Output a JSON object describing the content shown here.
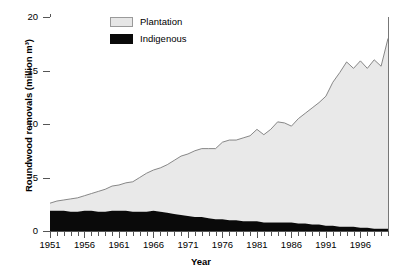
{
  "chart_data": {
    "type": "area",
    "stacked": true,
    "title": "",
    "xlabel": "Year",
    "ylabel": "Roundwood removals (million m³)",
    "xlim": [
      1951,
      2000
    ],
    "ylim": [
      0,
      20
    ],
    "yticks": [
      0,
      5,
      10,
      15,
      20
    ],
    "ytick_labels": [
      "0",
      "5",
      "10",
      "15",
      "20"
    ],
    "xticks": [
      1951,
      1956,
      1961,
      1966,
      1971,
      1976,
      1981,
      1986,
      1991,
      1996
    ],
    "xtick_labels": [
      "1951",
      "1956",
      "1961",
      "1966",
      "1971",
      "1976",
      "1981",
      "1986",
      "1991",
      "1996"
    ],
    "grid": false,
    "legend_position": "top-left-inside",
    "x": [
      1951,
      1952,
      1953,
      1954,
      1955,
      1956,
      1957,
      1958,
      1959,
      1960,
      1961,
      1962,
      1963,
      1964,
      1965,
      1966,
      1967,
      1968,
      1969,
      1970,
      1971,
      1972,
      1973,
      1974,
      1975,
      1976,
      1977,
      1978,
      1979,
      1980,
      1981,
      1982,
      1983,
      1984,
      1985,
      1986,
      1987,
      1988,
      1989,
      1990,
      1991,
      1992,
      1993,
      1994,
      1995,
      1996,
      1997,
      1998,
      1999,
      2000
    ],
    "series": [
      {
        "name": "Indigenous",
        "color": "#0a0a0a",
        "values": [
          1.9,
          1.9,
          1.9,
          1.8,
          1.8,
          1.9,
          1.9,
          1.8,
          1.8,
          1.9,
          1.9,
          1.9,
          1.8,
          1.8,
          1.8,
          1.9,
          1.8,
          1.7,
          1.6,
          1.5,
          1.4,
          1.3,
          1.3,
          1.2,
          1.1,
          1.1,
          1.0,
          1.0,
          0.9,
          0.9,
          0.9,
          0.8,
          0.8,
          0.8,
          0.8,
          0.8,
          0.7,
          0.7,
          0.6,
          0.6,
          0.5,
          0.5,
          0.4,
          0.4,
          0.4,
          0.3,
          0.3,
          0.2,
          0.2,
          0.2
        ]
      },
      {
        "name": "Plantation",
        "color": "#e6e6e6",
        "values": [
          0.7,
          0.9,
          1.0,
          1.2,
          1.3,
          1.4,
          1.6,
          1.9,
          2.1,
          2.3,
          2.4,
          2.6,
          2.8,
          3.2,
          3.6,
          3.8,
          4.1,
          4.5,
          5.0,
          5.5,
          5.8,
          6.2,
          6.4,
          6.5,
          6.6,
          7.2,
          7.5,
          7.5,
          7.8,
          8.0,
          8.6,
          8.2,
          8.7,
          9.4,
          9.3,
          9.0,
          9.8,
          10.3,
          10.9,
          11.4,
          12.1,
          13.4,
          14.4,
          15.4,
          14.8,
          15.6,
          14.9,
          15.8,
          15.2,
          17.8
        ]
      },
      {
        "name": "Total",
        "color": "#808080",
        "values": [
          2.6,
          2.8,
          2.9,
          3.0,
          3.1,
          3.3,
          3.5,
          3.7,
          3.9,
          4.2,
          4.3,
          4.5,
          4.6,
          5.0,
          5.4,
          5.7,
          5.9,
          6.2,
          6.6,
          7.0,
          7.2,
          7.5,
          7.7,
          7.7,
          7.7,
          8.3,
          8.5,
          8.5,
          8.7,
          8.9,
          9.5,
          9.0,
          9.5,
          10.2,
          10.1,
          9.8,
          10.5,
          11.0,
          11.5,
          12.0,
          12.6,
          13.9,
          14.8,
          15.8,
          15.2,
          15.9,
          15.2,
          16.0,
          15.4,
          18.0
        ]
      }
    ],
    "legend": [
      {
        "label": "Plantation",
        "swatch": "plantation"
      },
      {
        "label": "Indigenous",
        "swatch": "indigenous"
      }
    ]
  }
}
